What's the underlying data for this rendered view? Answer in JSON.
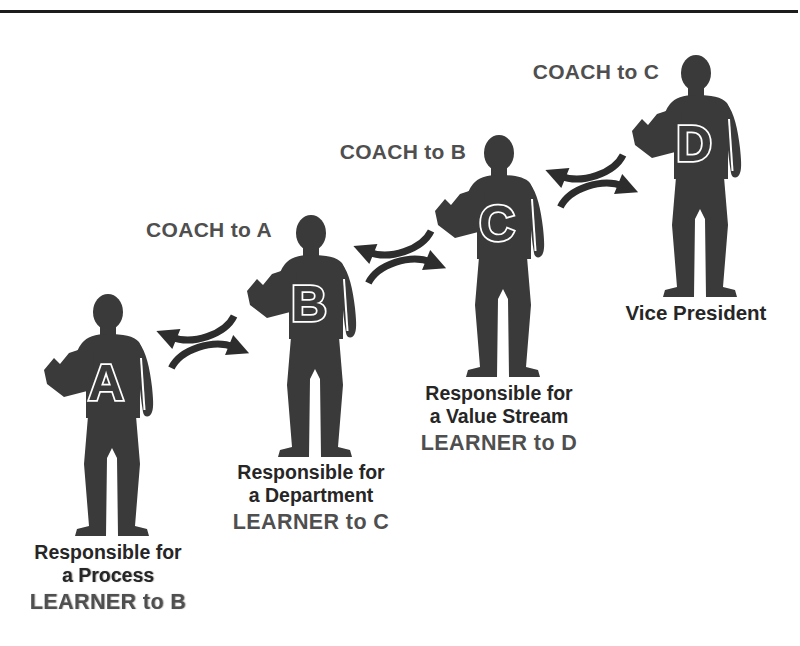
{
  "colors": {
    "background": "#ffffff",
    "rule": "#1c1c1c",
    "silhouette": "#3a3a3a",
    "arrow": "#2d2d2d",
    "role_text": "#262626",
    "muted_text": "#4f4f4f"
  },
  "figures": [
    {
      "letter": "A",
      "role_lines": [
        "Responsible for",
        "a Process"
      ],
      "learner_label": "LEARNER to B"
    },
    {
      "letter": "B",
      "coach_label": "COACH to A",
      "role_lines": [
        "Responsible for",
        "a Department"
      ],
      "learner_label": "LEARNER to C"
    },
    {
      "letter": "C",
      "coach_label": "COACH to B",
      "role_lines": [
        "Responsible for",
        "a Value Stream"
      ],
      "learner_label": "LEARNER to D"
    },
    {
      "letter": "D",
      "coach_label": "COACH to C",
      "role_lines": [
        "Vice President"
      ]
    }
  ]
}
